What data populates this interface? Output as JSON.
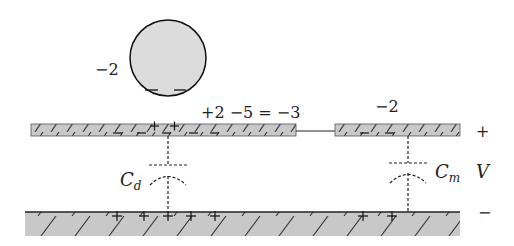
{
  "diagram": {
    "sphere": {
      "charge_label": "−2",
      "fill": "#dcdcdc",
      "stroke": "#111111"
    },
    "left_plate": {
      "charge_label": "+2 −5 = −3",
      "fill": "#c8c8c8"
    },
    "right_plate": {
      "charge_label": "−2",
      "fill": "#c8c8c8"
    },
    "ground_plate": {
      "fill": "#c8c8c8"
    },
    "capacitors": [
      {
        "name": "Cd",
        "symbol": "C",
        "subscript": "d"
      },
      {
        "name": "Cm",
        "symbol": "C",
        "subscript": "m"
      }
    ],
    "voltage": {
      "plus": "+",
      "label": "V",
      "minus": "−"
    }
  }
}
